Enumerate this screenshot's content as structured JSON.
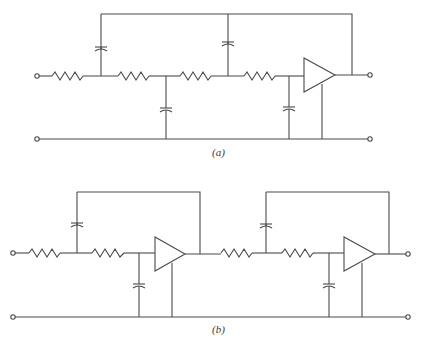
{
  "figure": {
    "diagram_a": {
      "label": "(a)",
      "description": "Four-section RC ladder (R-C-R-C-R-C-R-C) with alternating capacitors to feedback line and ground, driving a unity-gain amplifier with positive feedback loop",
      "components": [
        "input-terminal",
        "R1",
        "C1-feedback",
        "R2",
        "C2-ground",
        "R3",
        "C3-feedback",
        "R4",
        "C4-ground",
        "amplifier",
        "output-terminal"
      ]
    },
    "diagram_b": {
      "label": "(b)",
      "description": "Two cascaded second-order Sallen-Key sections, each R-C(feedback)-R-C(ground) driving a unity-gain amplifier",
      "components": [
        "input-terminal",
        "R1",
        "C1-feedback",
        "R2",
        "C2-ground",
        "amplifier-1",
        "R3",
        "C3-feedback",
        "R4",
        "C4-ground",
        "amplifier-2",
        "output-terminal"
      ]
    }
  },
  "colors": {
    "line": "#4a4a4a",
    "background": "#ffffff"
  }
}
